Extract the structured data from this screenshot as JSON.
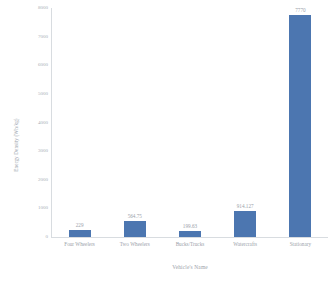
{
  "chart_data": {
    "type": "bar",
    "title": "",
    "xlabel": "Vehicle's Name",
    "ylabel": "Energy Density (Wh/kg)",
    "categories": [
      "Four Wheelers",
      "Two Wheelers",
      "Bucks/Trucks",
      "Watercrafts",
      "Stationary"
    ],
    "values": [
      229,
      564.75,
      199.63,
      914.127,
      7770
    ],
    "value_labels": [
      "229",
      "564.75",
      "199.63",
      "914.127",
      "7770"
    ],
    "ylim": [
      0,
      8000
    ],
    "yticks": [
      0,
      1000,
      2000,
      3000,
      4000,
      5000,
      6000,
      7000,
      8000
    ],
    "ytick_labels": [
      "0",
      "1000",
      "2000",
      "3000",
      "4000",
      "5000",
      "6000",
      "7000",
      "8000"
    ],
    "grid": false,
    "legend": "none",
    "bar_color": "#4c76b0",
    "text_color": "#9ba2aa",
    "axis_color": "#d8dce0",
    "background": "#ffffff"
  }
}
